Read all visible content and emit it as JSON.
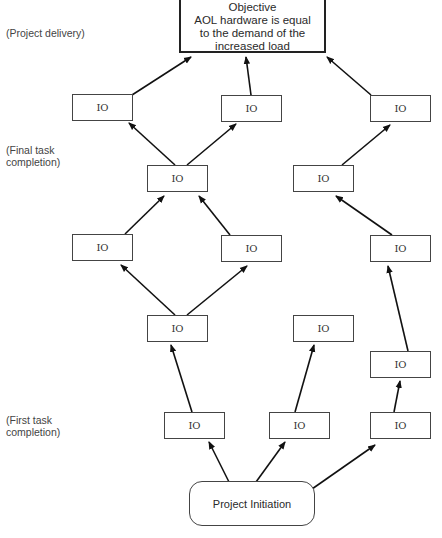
{
  "objective": {
    "lines": [
      "Objective",
      "AOL hardware is equal",
      "to the demand of the",
      "increased load"
    ]
  },
  "initiation": {
    "label": "Project Initiation"
  },
  "stage_labels": {
    "project_delivery": "(Project delivery)",
    "final_task": "(Final task\ncompletion)",
    "first_task": "(First task\ncompletion)"
  },
  "io_nodes": [
    {
      "id": "io-1",
      "label": "IO",
      "x": 72,
      "y": 94
    },
    {
      "id": "io-2",
      "label": "IO",
      "x": 221,
      "y": 95
    },
    {
      "id": "io-3",
      "label": "IO",
      "x": 370,
      "y": 95
    },
    {
      "id": "io-4",
      "label": "IO",
      "x": 147,
      "y": 165
    },
    {
      "id": "io-5",
      "label": "IO",
      "x": 293,
      "y": 165
    },
    {
      "id": "io-6",
      "label": "IO",
      "x": 72,
      "y": 234
    },
    {
      "id": "io-7",
      "label": "IO",
      "x": 221,
      "y": 235
    },
    {
      "id": "io-8",
      "label": "IO",
      "x": 370,
      "y": 235
    },
    {
      "id": "io-9",
      "label": "IO",
      "x": 147,
      "y": 315
    },
    {
      "id": "io-10",
      "label": "IO",
      "x": 293,
      "y": 315
    },
    {
      "id": "io-11",
      "label": "IO",
      "x": 370,
      "y": 351
    },
    {
      "id": "io-12",
      "label": "IO",
      "x": 164,
      "y": 412
    },
    {
      "id": "io-13",
      "label": "IO",
      "x": 269,
      "y": 412
    },
    {
      "id": "io-14",
      "label": "IO",
      "x": 370,
      "y": 412
    }
  ],
  "colors": {
    "line": "#111111",
    "border": "#444444",
    "text": "#333333"
  }
}
